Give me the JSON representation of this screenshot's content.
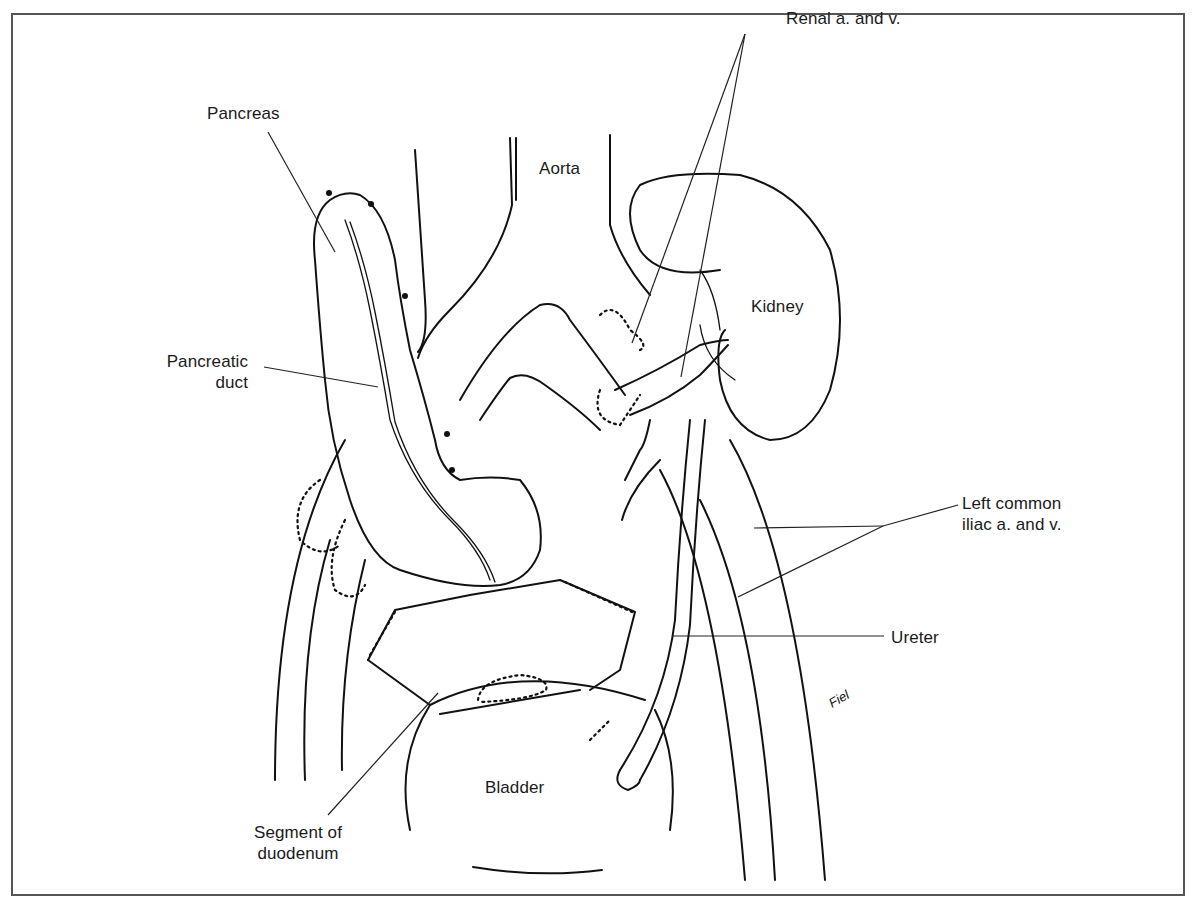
{
  "figure": {
    "frame_color": "#555555",
    "line_color": "#111111",
    "background": "#ffffff"
  },
  "labels": {
    "renal": {
      "text": "Renal a. and v.",
      "x": 786,
      "y": 8
    },
    "pancreas": {
      "text": "Pancreas",
      "x": 207,
      "y": 103
    },
    "aorta": {
      "text": "Aorta",
      "x": 539,
      "y": 158
    },
    "kidney": {
      "text": "Kidney",
      "x": 751,
      "y": 296
    },
    "pancreatic_duct": {
      "line1": "Pancreatic",
      "line2": "duct",
      "x": 140,
      "y": 351
    },
    "left_common_iliac": {
      "line1": "Left common",
      "line2": "iliac a. and v.",
      "x": 962,
      "y": 493
    },
    "ureter": {
      "text": "Ureter",
      "x": 891,
      "y": 627
    },
    "bladder": {
      "text": "Bladder",
      "x": 485,
      "y": 777
    },
    "segment_of_duodenum": {
      "line1": "Segment of",
      "line2": "duodenum",
      "x": 240,
      "y": 822
    }
  },
  "signature": "Fiel"
}
